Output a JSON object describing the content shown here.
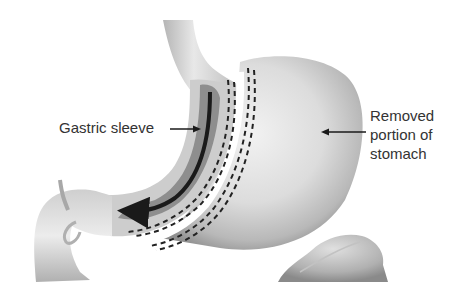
{
  "diagram": {
    "type": "anatomical-illustration",
    "labels": {
      "gastric_sleeve": "Gastric sleeve",
      "removed_portion": {
        "line1": "Removed",
        "line2": "portion of",
        "line3": "stomach"
      }
    },
    "structures": [
      "esophagus",
      "gastric-sleeve",
      "removed-stomach-portion",
      "staple-lines",
      "duodenum",
      "bile-duct",
      "pancreas-fragment"
    ],
    "colors": {
      "tissue_light": "#e6e6e6",
      "tissue_mid": "#c8c8c8",
      "tissue_dark": "#9a9a9a",
      "sleeve_inner": "#8c8c8c",
      "arrow": "#1a1a1a",
      "staples": "#222222",
      "text": "#333333"
    }
  }
}
